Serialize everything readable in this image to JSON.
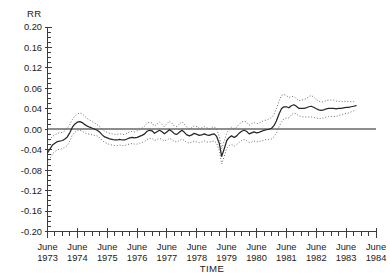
{
  "chart_data": {
    "type": "line",
    "title": "",
    "ylabel": "RR",
    "xlabel": "TIME",
    "grid": false,
    "legend": null,
    "ylim": [
      -0.2,
      0.2
    ],
    "ytick_labels": [
      "0.20",
      "0.16",
      "0.12",
      "0.06",
      "0.04",
      "0.00",
      "-0.04",
      "-0.08",
      "-0.12",
      "-0.16",
      "-0.20"
    ],
    "ytick_values": [
      0.2,
      0.16,
      0.12,
      0.08,
      0.04,
      0.0,
      -0.04,
      -0.08,
      -0.12,
      -0.16,
      -0.2
    ],
    "xtick_labels": [
      {
        "month": "June",
        "year": "1973"
      },
      {
        "month": "June",
        "year": "1974"
      },
      {
        "month": "June",
        "year": "1975"
      },
      {
        "month": "June",
        "year": "1976"
      },
      {
        "month": "June",
        "year": "1977"
      },
      {
        "month": "June",
        "year": "1978"
      },
      {
        "month": "June",
        "year": "1979"
      },
      {
        "month": "June",
        "year": "1980"
      },
      {
        "month": "June",
        "year": "1981"
      },
      {
        "month": "June",
        "year": "1982"
      },
      {
        "month": "June",
        "year": "1983"
      },
      {
        "month": "June",
        "year": "1984"
      }
    ],
    "xlim_years": [
      1973.4167,
      1984.4167
    ],
    "minor_ticks_per_year": 4,
    "reference_line": 0.0,
    "x": [
      1973.42,
      1973.58,
      1973.75,
      1973.92,
      1974.0,
      1974.08,
      1974.17,
      1974.25,
      1974.33,
      1974.42,
      1974.5,
      1974.58,
      1974.67,
      1974.75,
      1974.83,
      1974.92,
      1975.0,
      1975.08,
      1975.17,
      1975.25,
      1975.33,
      1975.42,
      1975.5,
      1975.58,
      1975.67,
      1975.75,
      1975.83,
      1975.92,
      1976.0,
      1976.08,
      1976.17,
      1976.25,
      1976.33,
      1976.42,
      1976.5,
      1976.58,
      1976.67,
      1976.75,
      1976.83,
      1976.92,
      1977.0,
      1977.08,
      1977.17,
      1977.25,
      1977.33,
      1977.42,
      1977.5,
      1977.58,
      1977.67,
      1977.75,
      1977.83,
      1977.92,
      1978.0,
      1978.08,
      1978.17,
      1978.25,
      1978.33,
      1978.42,
      1978.5,
      1978.58,
      1978.67,
      1978.75,
      1978.83,
      1978.92,
      1979.0,
      1979.08,
      1979.17,
      1979.25,
      1979.33,
      1979.42,
      1979.5,
      1979.58,
      1979.67,
      1979.75,
      1979.83,
      1979.92,
      1980.0,
      1980.08,
      1980.17,
      1980.25,
      1980.33,
      1980.42,
      1980.5,
      1980.58,
      1980.67,
      1980.75,
      1980.83,
      1980.92,
      1981.0,
      1981.08,
      1981.17,
      1981.25,
      1981.33,
      1981.42,
      1981.5,
      1981.58,
      1981.67,
      1981.75,
      1981.83,
      1981.92,
      1982.0,
      1982.08,
      1982.17,
      1982.25,
      1982.33,
      1982.42,
      1982.5,
      1982.58,
      1982.67,
      1982.75,
      1982.83,
      1982.92,
      1983.0,
      1983.08,
      1983.17,
      1983.25,
      1983.33,
      1983.42,
      1983.5,
      1983.58,
      1983.67,
      1983.75
    ],
    "series": [
      {
        "name": "estimate",
        "style": "solid",
        "values": [
          -0.046,
          -0.031,
          -0.024,
          -0.022,
          -0.019,
          -0.015,
          -0.006,
          0.004,
          0.01,
          0.014,
          0.015,
          0.013,
          0.009,
          0.006,
          0.004,
          0.002,
          0.0,
          -0.002,
          -0.006,
          -0.011,
          -0.015,
          -0.017,
          -0.019,
          -0.02,
          -0.021,
          -0.021,
          -0.02,
          -0.021,
          -0.021,
          -0.019,
          -0.017,
          -0.016,
          -0.017,
          -0.016,
          -0.014,
          -0.012,
          -0.009,
          -0.004,
          -0.002,
          -0.003,
          -0.008,
          -0.005,
          -0.002,
          -0.005,
          -0.009,
          -0.005,
          -0.001,
          -0.004,
          -0.009,
          -0.01,
          -0.006,
          -0.002,
          -0.006,
          -0.011,
          -0.013,
          -0.011,
          -0.008,
          -0.01,
          -0.012,
          -0.011,
          -0.009,
          -0.011,
          -0.012,
          -0.01,
          -0.009,
          -0.014,
          -0.028,
          -0.053,
          -0.039,
          -0.022,
          -0.016,
          -0.013,
          -0.016,
          -0.013,
          -0.008,
          -0.004,
          -0.002,
          -0.004,
          -0.009,
          -0.007,
          -0.005,
          -0.007,
          -0.006,
          -0.004,
          -0.002,
          -0.001,
          0.0,
          0.002,
          0.007,
          0.016,
          0.03,
          0.04,
          0.044,
          0.044,
          0.042,
          0.046,
          0.048,
          0.045,
          0.041,
          0.041,
          0.041,
          0.042,
          0.044,
          0.045,
          0.043,
          0.04,
          0.038,
          0.037,
          0.038,
          0.04,
          0.041,
          0.041,
          0.041,
          0.04,
          0.041,
          0.041,
          0.042,
          0.043,
          0.043,
          0.044,
          0.045,
          0.046
        ]
      },
      {
        "name": "upper-confidence-limit",
        "style": "dotted",
        "values": [
          -0.026,
          -0.014,
          -0.008,
          -0.006,
          -0.003,
          0.002,
          0.01,
          0.019,
          0.026,
          0.03,
          0.032,
          0.03,
          0.025,
          0.021,
          0.018,
          0.015,
          0.012,
          0.009,
          0.005,
          0.0,
          -0.004,
          -0.006,
          -0.008,
          -0.009,
          -0.01,
          -0.01,
          -0.009,
          -0.01,
          -0.01,
          -0.008,
          -0.005,
          -0.004,
          -0.005,
          -0.003,
          -0.001,
          0.002,
          0.006,
          0.012,
          0.014,
          0.012,
          0.006,
          0.01,
          0.014,
          0.01,
          0.005,
          0.011,
          0.016,
          0.012,
          0.006,
          0.005,
          0.01,
          0.015,
          0.01,
          0.004,
          0.001,
          0.003,
          0.007,
          0.005,
          0.002,
          0.003,
          0.005,
          0.003,
          0.001,
          0.004,
          0.005,
          -0.001,
          -0.014,
          -0.038,
          -0.024,
          -0.007,
          0.0,
          0.004,
          0.001,
          0.004,
          0.01,
          0.014,
          0.016,
          0.014,
          0.008,
          0.011,
          0.013,
          0.011,
          0.012,
          0.015,
          0.017,
          0.018,
          0.02,
          0.023,
          0.029,
          0.04,
          0.055,
          0.066,
          0.068,
          0.066,
          0.062,
          0.064,
          0.064,
          0.06,
          0.056,
          0.057,
          0.058,
          0.06,
          0.064,
          0.066,
          0.063,
          0.058,
          0.055,
          0.053,
          0.054,
          0.056,
          0.057,
          0.057,
          0.057,
          0.055,
          0.055,
          0.054,
          0.054,
          0.055,
          0.054,
          0.054,
          0.054,
          0.054
        ]
      },
      {
        "name": "lower-confidence-limit",
        "style": "dotted",
        "values": [
          -0.066,
          -0.048,
          -0.04,
          -0.038,
          -0.035,
          -0.032,
          -0.022,
          -0.011,
          -0.006,
          -0.002,
          -0.002,
          -0.004,
          -0.007,
          -0.009,
          -0.01,
          -0.011,
          -0.012,
          -0.013,
          -0.017,
          -0.022,
          -0.026,
          -0.028,
          -0.03,
          -0.031,
          -0.032,
          -0.032,
          -0.031,
          -0.032,
          -0.032,
          -0.03,
          -0.029,
          -0.028,
          -0.029,
          -0.029,
          -0.027,
          -0.026,
          -0.024,
          -0.02,
          -0.018,
          -0.018,
          -0.022,
          -0.02,
          -0.018,
          -0.02,
          -0.023,
          -0.021,
          -0.018,
          -0.02,
          -0.024,
          -0.025,
          -0.022,
          -0.019,
          -0.022,
          -0.026,
          -0.027,
          -0.025,
          -0.023,
          -0.025,
          -0.026,
          -0.025,
          -0.023,
          -0.025,
          -0.025,
          -0.024,
          -0.023,
          -0.027,
          -0.042,
          -0.068,
          -0.054,
          -0.037,
          -0.032,
          -0.03,
          -0.033,
          -0.03,
          -0.026,
          -0.022,
          -0.02,
          -0.022,
          -0.026,
          -0.025,
          -0.023,
          -0.025,
          -0.024,
          -0.023,
          -0.021,
          -0.02,
          -0.02,
          -0.019,
          -0.015,
          -0.008,
          0.005,
          0.014,
          0.02,
          0.022,
          0.022,
          0.028,
          0.032,
          0.03,
          0.026,
          0.025,
          0.024,
          0.024,
          0.024,
          0.024,
          0.023,
          0.022,
          0.021,
          0.021,
          0.022,
          0.024,
          0.025,
          0.025,
          0.025,
          0.025,
          0.027,
          0.028,
          0.03,
          0.031,
          0.032,
          0.034,
          0.036,
          0.038
        ]
      }
    ]
  },
  "colors": {
    "axis": "#3b3b3b",
    "series_main": "#262626",
    "series_band": "#6e6e6e",
    "zero_line": "#8d8d8d",
    "background": "#ffffff",
    "text": "#1a1a1a"
  }
}
